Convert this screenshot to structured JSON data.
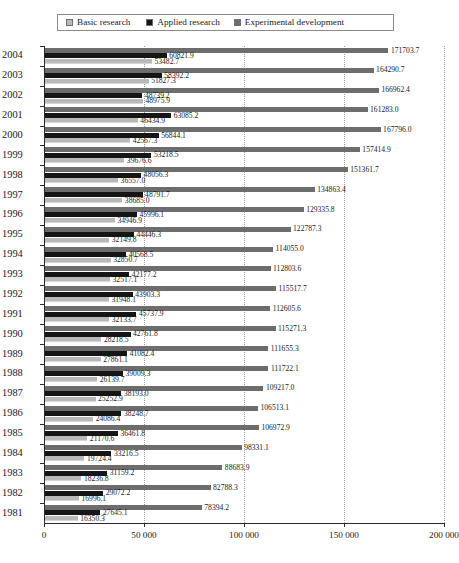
{
  "legend": {
    "items": [
      {
        "label": "Basic research",
        "color": "#b9b9b9",
        "key": "basic"
      },
      {
        "label": "Applied research",
        "color": "#151515",
        "key": "applied"
      },
      {
        "label": "Experimental development",
        "color": "#6d6d6d",
        "key": "experimental"
      }
    ]
  },
  "axis": {
    "x_ticks": [
      "0",
      "50 000",
      "100 000",
      "150 000",
      "200 000"
    ],
    "x_tick_values": [
      0,
      50000,
      100000,
      150000,
      200000
    ],
    "xlim": [
      0,
      200000
    ]
  },
  "chart_data": {
    "type": "bar",
    "orientation": "horizontal",
    "title": "",
    "xlabel": "",
    "ylabel": "",
    "xlim": [
      0,
      200000
    ],
    "grid": "vertical-dotted",
    "legend_position": "top",
    "categories": [
      "2004",
      "2003",
      "2002",
      "2001",
      "2000",
      "1999",
      "1998",
      "1997",
      "1996",
      "1995",
      "1994",
      "1993",
      "1992",
      "1991",
      "1990",
      "1989",
      "1988",
      "1987",
      "1986",
      "1985",
      "1984",
      "1983",
      "1982",
      "1981"
    ],
    "series": [
      {
        "name": "Experimental development",
        "color": "#6d6d6d",
        "values": [
          171703.7,
          164290.7,
          166962.4,
          161283.0,
          167796.0,
          157414.9,
          151361.7,
          134863.4,
          129335.8,
          122787.3,
          114055.0,
          112803.6,
          115517.7,
          112605.6,
          115271.3,
          111655.3,
          111722.1,
          109217.0,
          106513.1,
          106972.9,
          98331.1,
          88683.9,
          82788.3,
          78394.2
        ],
        "labels": [
          "171703.7",
          "164290.7",
          "166962.4",
          "161283.0",
          "167796.0",
          "157414.9",
          "151361.7",
          "134863.4",
          "129335.8",
          "122787.3",
          "114055.0",
          "112803.6",
          "115517.7",
          "112605.6",
          "115271.3",
          "111655.3",
          "111722.1",
          "109217.0",
          "106513.1",
          "106972.9",
          "98331.1",
          "88683.9",
          "82788.3",
          "78394.2"
        ]
      },
      {
        "name": "Applied research",
        "color": "#151515",
        "values": [
          60821.9,
          58392.2,
          48739.2,
          63085.2,
          56844.1,
          53218.5,
          48056.3,
          48791.7,
          45996.1,
          44446.3,
          40568.5,
          42177.2,
          43903.3,
          45737.9,
          42761.8,
          41082.4,
          39009.3,
          38193.0,
          38248.7,
          36461.8,
          33216.5,
          31159.2,
          29072.2,
          27645.1
        ],
        "labels": [
          "60821.9",
          "58392.2",
          "48739.2",
          "63085.2",
          "56844.1",
          "53218.5",
          "48056.3",
          "48791.7",
          "45996.1",
          "44446.3",
          "40568.5",
          "42177.2",
          "43903.3",
          "45737.9",
          "42761.8",
          "41082.4",
          "39009.3",
          "38193.0",
          "38248.7",
          "36461.8",
          "33216.5",
          "31159.2",
          "29072.2",
          "27645.1"
        ]
      },
      {
        "name": "Basic research",
        "color": "#b9b9b9",
        "values": [
          53482.7,
          51827.3,
          48975.9,
          46434.9,
          42567.3,
          39676.6,
          36557.0,
          38685.0,
          34946.9,
          32149.8,
          32850.7,
          32517.1,
          31948.1,
          32133.7,
          28218.5,
          27861.1,
          26139.7,
          25252.9,
          24086.4,
          21170.6,
          19724.4,
          18236.8,
          16996.1,
          16350.3
        ],
        "labels": [
          "53482.7",
          "51827.3",
          "48975.9",
          "46434.9",
          "42567.3",
          "39676.6",
          "36557.0",
          "38685.0",
          "34946.9",
          "32149.8",
          "32850.7",
          "32517.1",
          "31948.1",
          "32133.7",
          "28218.5",
          "27861.1",
          "26139.7",
          "25252.9",
          "24086.4",
          "21170.6",
          "19724.4",
          "18236.8",
          "16996.1",
          "16350.3"
        ]
      }
    ]
  }
}
